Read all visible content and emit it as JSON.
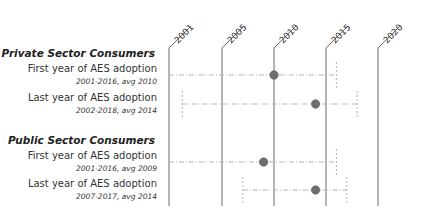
{
  "chart_data": {
    "type": "scatter",
    "title": "",
    "xlabel": "",
    "ylabel": "",
    "x_ticks": [
      "2001",
      "2005",
      "2010",
      "2015",
      "2020"
    ],
    "x_tick_values": [
      2001,
      2005,
      2010,
      2015,
      2020
    ],
    "xlim": [
      2001,
      2020
    ],
    "grid": "vertical lines at each tick",
    "legend": "none",
    "groups": [
      {
        "title": "Private Sector Consumers",
        "rows": [
          {
            "label": "First year of AES adoption",
            "sublabel": "2001-2016, avg 2010",
            "min": 2001,
            "max": 2016,
            "avg": 2010
          },
          {
            "label": "Last year of AES adoption",
            "sublabel": "2002-2018, avg 2014",
            "min": 2002,
            "max": 2018,
            "avg": 2014
          }
        ]
      },
      {
        "title": "Public Sector Consumers",
        "rows": [
          {
            "label": "First year of AES adoption",
            "sublabel": "2001-2016, avg 2009",
            "min": 2001,
            "max": 2016,
            "avg": 2009
          },
          {
            "label": "Last year of AES adoption",
            "sublabel": "2007-2017, avg 2014",
            "min": 2007,
            "max": 2017,
            "avg": 2014
          }
        ]
      }
    ],
    "colors": {
      "dot": "#6e6e6e",
      "dot_stroke": "#555555",
      "axis_line": "#6b6b6b",
      "range_line": "#b5b5b5"
    }
  }
}
